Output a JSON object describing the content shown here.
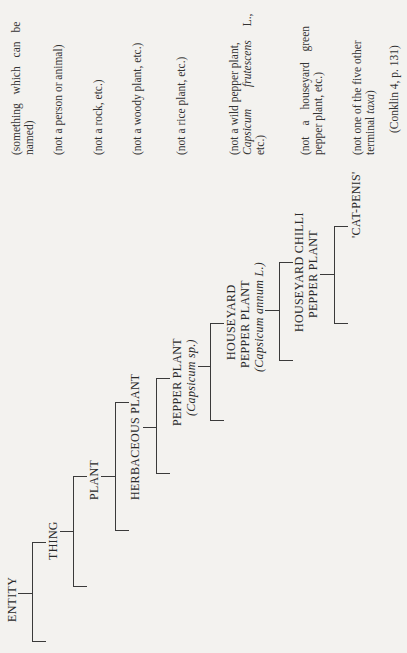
{
  "diagram": {
    "orientation": "rotated-90-ccw",
    "nodes": [
      {
        "id": "entity",
        "label": "ENTITY",
        "note": "(something which can be named)"
      },
      {
        "id": "thing",
        "label": "THING",
        "note": "(not a person or animal)"
      },
      {
        "id": "plant",
        "label": "PLANT",
        "note": "(not a rock, etc.)"
      },
      {
        "id": "herbaceous",
        "label": "HERBACEOUS PLANT",
        "note": "(not a woody plant, etc.)"
      },
      {
        "id": "pepper",
        "label": "PEPPER PLANT",
        "sci": "(Capsicum sp.)",
        "note": "(not a rice plant, etc.)"
      },
      {
        "id": "houseyard",
        "label1": "HOUSEYARD",
        "label2": "PEPPER PLANT",
        "sci": "(Capsicum annum L.)",
        "note1": "(not a wild pepper plant,",
        "note2_it": "Capsicum",
        "note2_it2": "frutescens",
        "note2_rest": "L.,",
        "note3": "etc.)"
      },
      {
        "id": "chilli",
        "label1": "HOUSEYARD CHILLI",
        "label2": "PEPPER PLANT",
        "note1": "(not a houseyard green",
        "note2": "pepper plant, etc.)"
      },
      {
        "id": "catpenis",
        "label": "'CAT-PENIS'",
        "note1": "(not one of the five other",
        "note2_a": "terminal ",
        "note2_it": "taxa",
        "note2_b": ")"
      }
    ],
    "citation": "(Conklin 4, p. 131)"
  }
}
